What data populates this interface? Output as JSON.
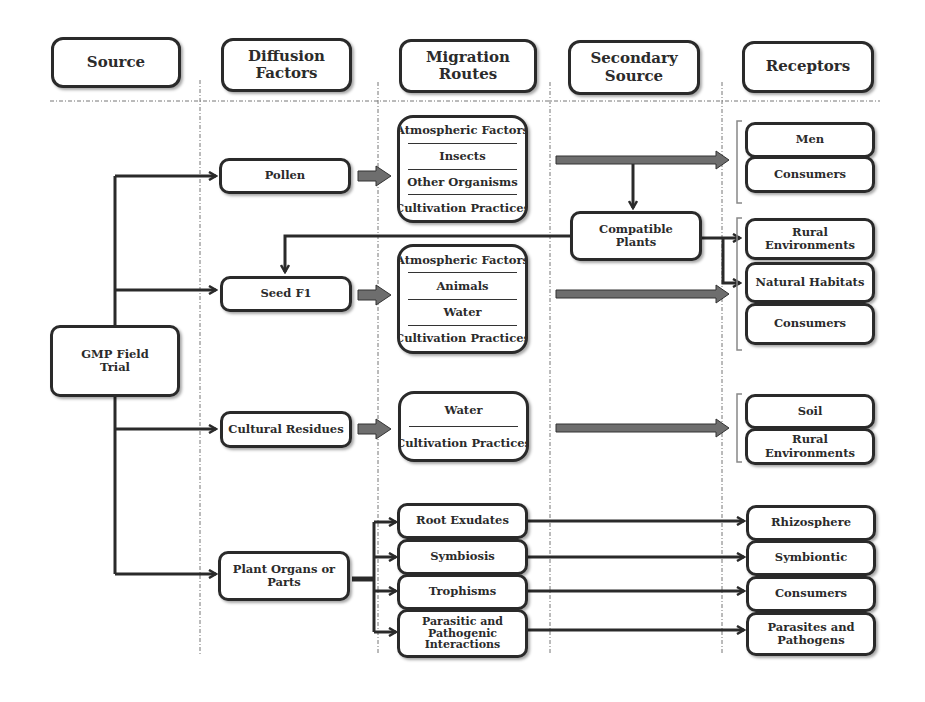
{
  "headers": {
    "source": "Source",
    "diffusion": "Diffusion\nFactors",
    "migration": "Migration\nRoutes",
    "secondary": "Secondary\nSource",
    "receptors": "Receptors"
  },
  "source": {
    "label": "GMP Field\nTrial"
  },
  "diffusion_factors": [
    {
      "label": "Pollen"
    },
    {
      "label": "Seed F1"
    },
    {
      "label": "Cultural Residues"
    },
    {
      "label": "Plant Organs or\nParts"
    }
  ],
  "migration_routes": {
    "pollen": [
      "Atmospheric Factors",
      "Insects",
      "Other Organisms",
      "Cultivation Practices"
    ],
    "seed": [
      "Atmospheric Factors",
      "Animals",
      "Water",
      "Cultivation Practices"
    ],
    "residues": [
      "Water",
      "Cultivation Practices"
    ],
    "organs": [
      "Root Exudates",
      "Symbiosis",
      "Trophisms",
      "Parasitic and\nPathogenic\nInteractions"
    ]
  },
  "secondary_source": {
    "label": "Compatible\nPlants"
  },
  "receptors": {
    "group1": [
      "Men",
      "Consumers"
    ],
    "group2": [
      "Rural\nEnvironments",
      "Natural Habitats",
      "Consumers"
    ],
    "group3": [
      "Soil",
      "Rural\nEnvironments"
    ],
    "group4": [
      "Rhizosphere",
      "Symbiontic",
      "Consumers",
      "Parasites and\nPathogens"
    ]
  },
  "colors": {
    "line": "#2a2a2a",
    "fat_arrow": "#6e6e6e",
    "guide": "#777777"
  }
}
